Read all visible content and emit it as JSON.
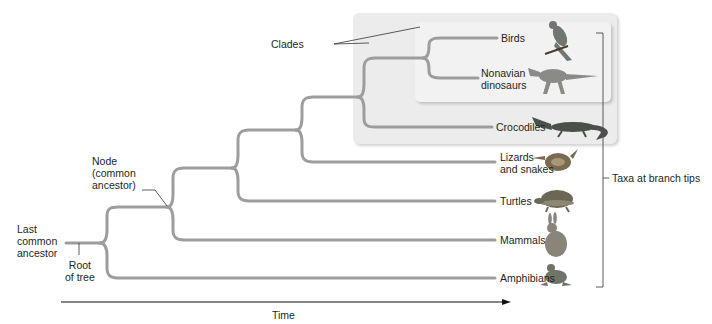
{
  "diagram": {
    "type": "phylogenetic-tree",
    "branch_color": "#9d9d9d",
    "clade_box_color": "#ececec",
    "labels": {
      "clades": "Clades",
      "node": [
        "Node",
        "(common",
        "ancestor)"
      ],
      "last_common_ancestor": [
        "Last",
        "common",
        "ancestor"
      ],
      "root": [
        "Root",
        "of tree"
      ],
      "taxa_bracket": "Taxa at branch tips",
      "time_axis": "Time"
    },
    "taxa": [
      {
        "name": "Birds",
        "lines": [
          "Birds"
        ],
        "icon": "bird-icon"
      },
      {
        "name": "Nonavian dinosaurs",
        "lines": [
          "Nonavian",
          "dinosaurs"
        ],
        "icon": "dinosaur-icon"
      },
      {
        "name": "Crocodiles",
        "lines": [
          "Crocodiles"
        ],
        "icon": "crocodile-icon"
      },
      {
        "name": "Lizards and snakes",
        "lines": [
          "Lizards",
          "and snakes"
        ],
        "icon": "snake-icon"
      },
      {
        "name": "Turtles",
        "lines": [
          "Turtles"
        ],
        "icon": "turtle-icon"
      },
      {
        "name": "Mammals",
        "lines": [
          "Mammals"
        ],
        "icon": "rabbit-icon"
      },
      {
        "name": "Amphibians",
        "lines": [
          "Amphibians"
        ],
        "icon": "frog-icon"
      }
    ],
    "clades_highlighted": [
      [
        "Birds",
        "Nonavian dinosaurs",
        "Crocodiles"
      ],
      [
        "Birds",
        "Nonavian dinosaurs"
      ]
    ]
  }
}
